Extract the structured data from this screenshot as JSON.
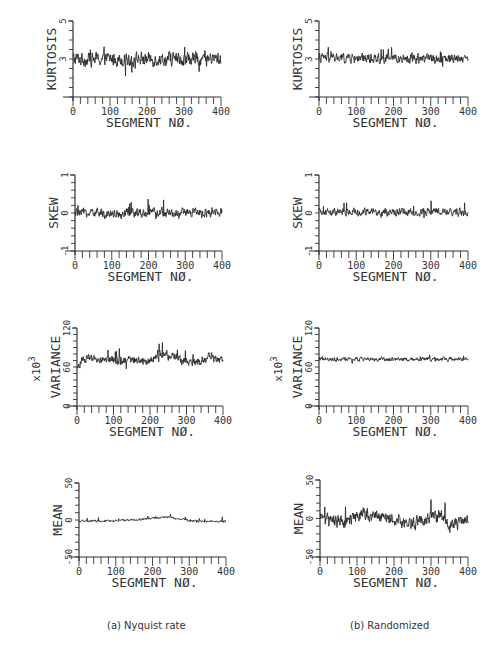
{
  "figure": {
    "captions": {
      "left": "(a) Nyquist rate",
      "right": "(b) Randomized"
    }
  },
  "chart_data": [
    {
      "id": "kurtosis-nyquist",
      "type": "line",
      "column": "left",
      "title": "",
      "xlabel": "SEGMENT NØ.",
      "ylabel": "KURTOSIS",
      "ylabel_multiplier": "",
      "xlim": [
        0,
        400
      ],
      "ylim": [
        1,
        5
      ],
      "x_ticks": [
        0,
        100,
        200,
        300,
        400
      ],
      "y_tick_labels": [
        {
          "value": 5,
          "label": "5"
        },
        {
          "value": 3,
          "label": "3"
        }
      ],
      "y_minor_step": 0.5,
      "series": [
        {
          "name": "kurtosis",
          "mean": 3.0,
          "noise": 0.35,
          "spikes": 0.9,
          "trend": []
        }
      ],
      "grid": false,
      "frame": {
        "left": 73,
        "top": 21,
        "right": 221,
        "bottom": 97
      }
    },
    {
      "id": "kurtosis-randomized",
      "type": "line",
      "column": "right",
      "title": "",
      "xlabel": "SEGMENT NØ.",
      "ylabel": "KURTOSIS",
      "ylabel_multiplier": "",
      "xlim": [
        0,
        400
      ],
      "ylim": [
        1,
        5
      ],
      "x_ticks": [
        0,
        100,
        200,
        300,
        400
      ],
      "y_tick_labels": [
        {
          "value": 5,
          "label": "5"
        },
        {
          "value": 3,
          "label": "3"
        }
      ],
      "y_minor_step": 0.5,
      "series": [
        {
          "name": "kurtosis",
          "mean": 3.05,
          "noise": 0.25,
          "spikes": 0.45,
          "trend": []
        }
      ],
      "grid": false,
      "frame": {
        "left": 319,
        "top": 21,
        "right": 468,
        "bottom": 97
      }
    },
    {
      "id": "skew-nyquist",
      "type": "line",
      "column": "left",
      "title": "",
      "xlabel": "SEGMENT NØ.",
      "ylabel": "SKEW",
      "ylabel_multiplier": "",
      "xlim": [
        0,
        400
      ],
      "ylim": [
        -1,
        1
      ],
      "x_ticks": [
        0,
        100,
        200,
        300,
        400
      ],
      "y_tick_labels": [
        {
          "value": 1,
          "label": "1"
        },
        {
          "value": 0,
          "label": "0"
        },
        {
          "value": -1,
          "label": "-1"
        }
      ],
      "y_minor_step": 0.2,
      "series": [
        {
          "name": "skew",
          "mean": 0.0,
          "noise": 0.12,
          "spikes": 0.3,
          "trend": []
        }
      ],
      "grid": false,
      "frame": {
        "left": 75,
        "top": 175,
        "right": 222,
        "bottom": 251
      }
    },
    {
      "id": "skew-randomized",
      "type": "line",
      "column": "right",
      "title": "",
      "xlabel": "SEGMENT NØ.",
      "ylabel": "SKEW",
      "ylabel_multiplier": "",
      "xlim": [
        0,
        400
      ],
      "ylim": [
        -1,
        1
      ],
      "x_ticks": [
        0,
        100,
        200,
        300,
        400
      ],
      "y_tick_labels": [
        {
          "value": 1,
          "label": "1"
        },
        {
          "value": 0,
          "label": "0"
        },
        {
          "value": -1,
          "label": "-1"
        }
      ],
      "y_minor_step": 0.2,
      "series": [
        {
          "name": "skew",
          "mean": 0.02,
          "noise": 0.1,
          "spikes": 0.2,
          "trend": []
        }
      ],
      "grid": false,
      "frame": {
        "left": 319,
        "top": 175,
        "right": 468,
        "bottom": 251
      }
    },
    {
      "id": "variance-nyquist",
      "type": "line",
      "column": "left",
      "title": "",
      "xlabel": "SEGMENT NØ.",
      "ylabel": "VARIANCE",
      "ylabel_multiplier": "x10^3",
      "xlim": [
        0,
        400
      ],
      "ylim": [
        0,
        120
      ],
      "x_ticks": [
        0,
        100,
        200,
        300,
        400
      ],
      "y_tick_labels": [
        {
          "value": 120,
          "label": "120"
        },
        {
          "value": 60,
          "label": "60"
        },
        {
          "value": 0,
          "label": "0"
        }
      ],
      "y_minor_step": 10,
      "series": [
        {
          "name": "variance",
          "mean": 72,
          "noise": 6,
          "spikes": 18,
          "trend": [
            [
              0,
              58
            ],
            [
              20,
              72
            ],
            [
              200,
              70
            ],
            [
              240,
              82
            ],
            [
              280,
              72
            ],
            [
              330,
              66
            ],
            [
              360,
              76
            ],
            [
              400,
              68
            ]
          ]
        }
      ],
      "grid": false,
      "frame": {
        "left": 77,
        "top": 328,
        "right": 223,
        "bottom": 406
      }
    },
    {
      "id": "variance-randomized",
      "type": "line",
      "column": "right",
      "title": "",
      "xlabel": "SEGMENT NØ.",
      "ylabel": "VARIANCE",
      "ylabel_multiplier": "x10^3",
      "xlim": [
        0,
        400
      ],
      "ylim": [
        0,
        120
      ],
      "x_ticks": [
        0,
        100,
        200,
        300,
        400
      ],
      "y_tick_labels": [
        {
          "value": 120,
          "label": "120"
        },
        {
          "value": 60,
          "label": "60"
        },
        {
          "value": 0,
          "label": "0"
        }
      ],
      "y_minor_step": 10,
      "series": [
        {
          "name": "variance",
          "mean": 72,
          "noise": 3,
          "spikes": 7,
          "trend": []
        }
      ],
      "grid": false,
      "frame": {
        "left": 319,
        "top": 328,
        "right": 468,
        "bottom": 406
      }
    },
    {
      "id": "mean-nyquist",
      "type": "line",
      "column": "left",
      "title": "",
      "xlabel": "SEGMENT NØ.",
      "ylabel": "MEAN",
      "ylabel_multiplier": "",
      "xlim": [
        0,
        400
      ],
      "ylim": [
        -50,
        50
      ],
      "x_ticks": [
        0,
        100,
        200,
        300,
        400
      ],
      "y_tick_labels": [
        {
          "value": 50,
          "label": "50"
        },
        {
          "value": 0,
          "label": "0"
        },
        {
          "value": -50,
          "label": "-50"
        }
      ],
      "y_minor_step": 10,
      "series": [
        {
          "name": "mean",
          "mean": -1,
          "noise": 1.5,
          "spikes": 4,
          "trend": [
            [
              0,
              -2
            ],
            [
              150,
              0
            ],
            [
              240,
              4
            ],
            [
              300,
              -1
            ],
            [
              400,
              -2
            ]
          ]
        }
      ],
      "grid": false,
      "frame": {
        "left": 79,
        "top": 483,
        "right": 226,
        "bottom": 557
      }
    },
    {
      "id": "mean-randomized",
      "type": "line",
      "column": "right",
      "title": "",
      "xlabel": "SEGMENT NØ.",
      "ylabel": "MEAN",
      "ylabel_multiplier": "",
      "xlim": [
        0,
        400
      ],
      "ylim": [
        -50,
        50
      ],
      "x_ticks": [
        0,
        100,
        200,
        300,
        400
      ],
      "y_tick_labels": [
        {
          "value": 50,
          "label": "50"
        },
        {
          "value": 0,
          "label": "0"
        },
        {
          "value": -50,
          "label": "-50"
        }
      ],
      "y_minor_step": 10,
      "series": [
        {
          "name": "mean",
          "mean": 0,
          "noise": 8,
          "spikes": 22,
          "trend": [
            [
              0,
              0
            ],
            [
              60,
              -6
            ],
            [
              120,
              6
            ],
            [
              250,
              -5
            ],
            [
              330,
              5
            ],
            [
              350,
              -10
            ],
            [
              400,
              0
            ]
          ]
        }
      ],
      "grid": false,
      "frame": {
        "left": 320,
        "top": 480,
        "right": 468,
        "bottom": 557
      }
    }
  ]
}
